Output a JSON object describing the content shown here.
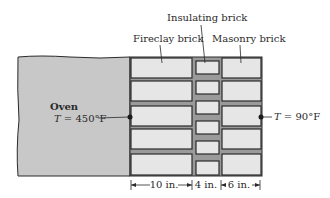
{
  "labels": {
    "insulating": "Insulating brick",
    "fireclay": "Fireclay brick",
    "masonry": "Masonry brick",
    "oven_title": "Oven",
    "oven_temp_var": "T",
    "oven_temp_val": " = 450°F",
    "outer_temp_var": "T",
    "outer_temp_val": " = 90°F"
  },
  "dimensions": {
    "fireclay": "10 in.",
    "insulating": "4 in.",
    "masonry": "6 in."
  },
  "colors": {
    "oven_fill": "#c8c8c8",
    "brick_fill": "#e6e6e6",
    "mortar": "#9a9a9a",
    "outline": "#2a2a2a"
  }
}
